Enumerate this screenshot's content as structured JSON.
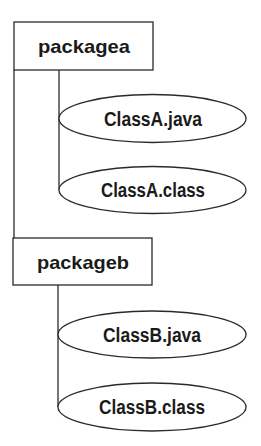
{
  "diagram": {
    "title": "",
    "line_color": "#2a2a2a",
    "packages": [
      {
        "name": "packagea",
        "files": [
          "ClassA.java",
          "ClassA.class"
        ]
      },
      {
        "name": "packageb",
        "files": [
          "ClassB.java",
          "ClassB.class"
        ]
      }
    ]
  }
}
